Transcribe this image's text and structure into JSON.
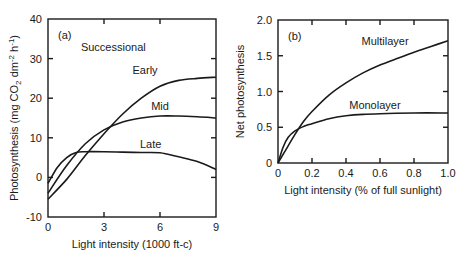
{
  "chart_data": [
    {
      "type": "line",
      "panel_label": "(a)",
      "annotation": "Successional",
      "title": "",
      "xlabel": "Light intensity (1000 ft-c)",
      "ylabel": "Photosynthesis (mg CO2 dm-2 h-1)",
      "xlim": [
        0,
        9
      ],
      "ylim": [
        -10,
        40
      ],
      "xticks": [
        0,
        3,
        6,
        9
      ],
      "yticks": [
        -10,
        0,
        10,
        20,
        30,
        40
      ],
      "grid": false,
      "legend": "none (curves labeled inline)",
      "series": [
        {
          "name": "Early",
          "x": [
            0,
            1,
            2,
            3,
            4,
            5,
            6,
            7,
            8,
            9
          ],
          "values": [
            -5.5,
            -0.5,
            5.5,
            11,
            16,
            20,
            23,
            24.5,
            25,
            25.3
          ]
        },
        {
          "name": "Mid",
          "x": [
            0,
            1,
            2,
            3,
            4,
            5,
            6,
            7,
            8,
            9
          ],
          "values": [
            -4,
            3,
            8.5,
            12,
            14,
            15,
            15.5,
            15.5,
            15.3,
            15
          ]
        },
        {
          "name": "Late",
          "x": [
            0,
            0.5,
            1,
            1.5,
            2,
            3,
            4,
            5,
            6,
            7,
            8,
            9
          ],
          "values": [
            -1.5,
            2.5,
            5,
            6.3,
            6.5,
            6.5,
            6.4,
            6.3,
            6.2,
            5.2,
            4,
            2
          ]
        }
      ],
      "label_positions": {
        "Early": [
          5.2,
          26
        ],
        "Mid": [
          6.0,
          17
        ],
        "Late": [
          5.5,
          7.5
        ]
      }
    },
    {
      "type": "line",
      "panel_label": "(b)",
      "title": "",
      "xlabel": "Light intensity (% of full sunlight)",
      "ylabel": "Net photosynthesis",
      "xlim": [
        0,
        1.0
      ],
      "ylim": [
        0,
        2.0
      ],
      "xticks": [
        0,
        0.2,
        0.4,
        0.6,
        0.8,
        1.0
      ],
      "yticks": [
        0,
        0.5,
        1.0,
        1.5,
        2.0
      ],
      "grid": false,
      "legend": "none (curves labeled inline)",
      "series": [
        {
          "name": "Multilayer",
          "x": [
            0,
            0.05,
            0.1,
            0.15,
            0.2,
            0.3,
            0.4,
            0.5,
            0.6,
            0.7,
            0.8,
            0.9,
            1.0
          ],
          "values": [
            0,
            0.2,
            0.4,
            0.58,
            0.72,
            0.95,
            1.12,
            1.26,
            1.37,
            1.46,
            1.55,
            1.63,
            1.71
          ]
        },
        {
          "name": "Monolayer",
          "x": [
            0,
            0.03,
            0.06,
            0.1,
            0.15,
            0.2,
            0.3,
            0.4,
            0.5,
            0.6,
            0.8,
            1.0
          ],
          "values": [
            0,
            0.22,
            0.36,
            0.45,
            0.51,
            0.55,
            0.62,
            0.66,
            0.68,
            0.69,
            0.7,
            0.7
          ]
        }
      ],
      "label_positions": {
        "Multilayer": [
          0.63,
          1.65
        ],
        "Monolayer": [
          0.57,
          0.75
        ]
      }
    }
  ]
}
